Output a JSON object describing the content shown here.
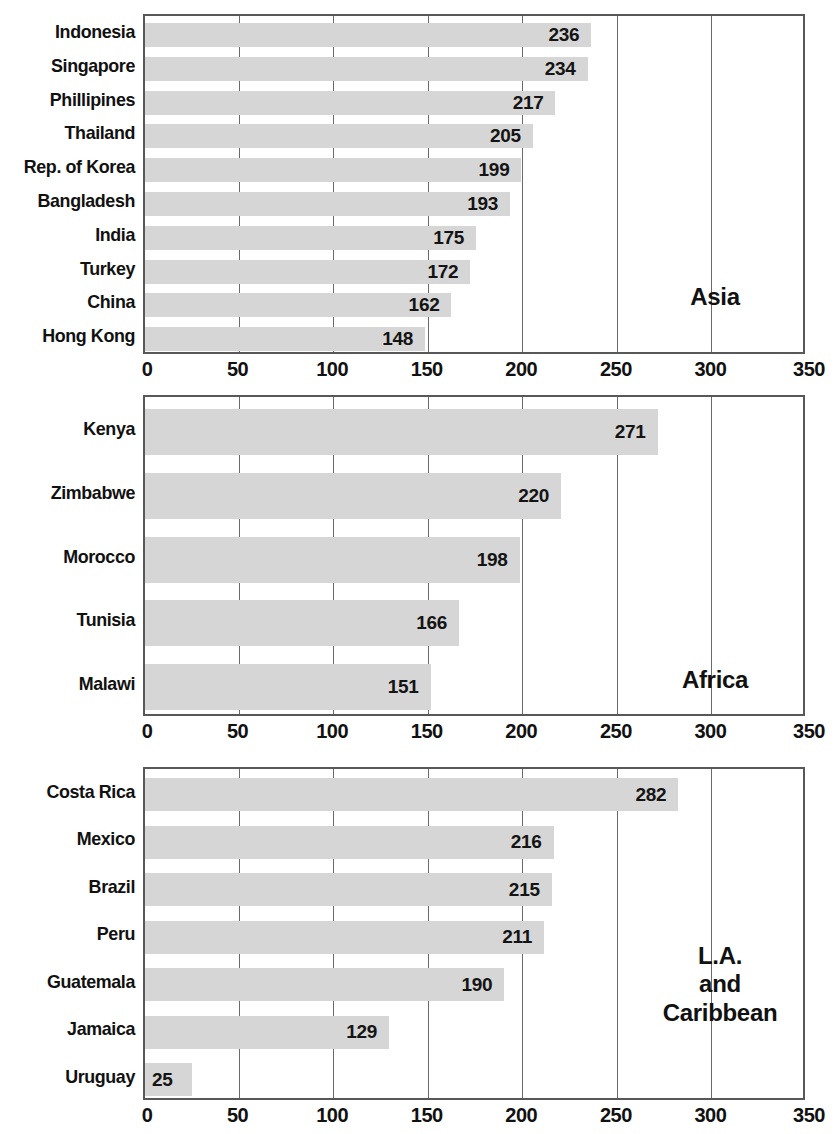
{
  "chart_data": {
    "type": "bar",
    "orientation": "horizontal",
    "title": "",
    "xlabel": "",
    "ylabel": "",
    "xlim": [
      0,
      350
    ],
    "xticks": [
      0,
      50,
      100,
      150,
      200,
      250,
      300,
      350
    ],
    "xtick_labels": [
      "0",
      "50",
      "100",
      "150",
      "200",
      "250",
      "300",
      "350"
    ],
    "grid": true,
    "bar_color": "#d6d6d6",
    "panels": [
      {
        "region": "Asia",
        "region_label_lines": [
          "Asia"
        ],
        "categories": [
          "Indonesia",
          "Singapore",
          "Phillipines",
          "Thailand",
          "Rep. of Korea",
          "Bangladesh",
          "India",
          "Turkey",
          "China",
          "Hong Kong"
        ],
        "values": [
          236,
          234,
          217,
          205,
          199,
          193,
          175,
          172,
          162,
          148
        ],
        "value_labels": [
          "236",
          "234",
          "217",
          "205",
          "199",
          "193",
          "175",
          "172",
          "162",
          "148"
        ]
      },
      {
        "region": "Africa",
        "region_label_lines": [
          "Africa"
        ],
        "categories": [
          "Kenya",
          "Zimbabwe",
          "Morocco",
          "Tunisia",
          "Malawi"
        ],
        "values": [
          271,
          220,
          198,
          166,
          151
        ],
        "value_labels": [
          "271",
          "220",
          "198",
          "166",
          "151"
        ]
      },
      {
        "region": "L.A. and Caribbean",
        "region_label_lines": [
          "L.A.",
          "and",
          "Caribbean"
        ],
        "categories": [
          "Costa Rica",
          "Mexico",
          "Brazil",
          "Peru",
          "Guatemala",
          "Jamaica",
          "Uruguay"
        ],
        "values": [
          282,
          216,
          215,
          211,
          190,
          129,
          25
        ],
        "value_labels": [
          "282",
          "216",
          "215",
          "211",
          "190",
          "129",
          "25"
        ]
      }
    ]
  }
}
